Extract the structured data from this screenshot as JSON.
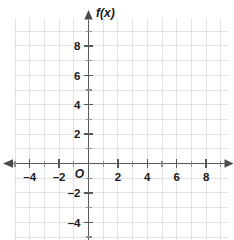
{
  "chart_data": {
    "type": "line",
    "title": "",
    "subtitle": "",
    "xlabel": "",
    "ylabel": "f(x)",
    "y_axis_name": "f(x)",
    "origin_label": "O",
    "grid": true,
    "grid_step": 1,
    "legend": null,
    "legend_position": "none",
    "series": [],
    "annotations": [],
    "xlim": [
      -5,
      9.5
    ],
    "ylim": [
      -5,
      9.5
    ],
    "x_major_step": 2,
    "x_minor_step": 1,
    "y_major_step": 2,
    "y_minor_step": 1,
    "x_tick_labels": [
      "–4",
      "–2",
      "2",
      "4",
      "6",
      "8"
    ],
    "x_tick_values": [
      -4,
      -2,
      2,
      4,
      6,
      8
    ],
    "y_tick_labels": [
      "8",
      "6",
      "4",
      "2",
      "–2",
      "–4"
    ],
    "y_tick_values": [
      8,
      6,
      4,
      2,
      -2,
      -4
    ],
    "colors": {
      "grid": "#e3e3e3",
      "axis": "#595959",
      "text": "#1a1a1a",
      "background": "#ffffff",
      "tick_minor": "#8d8d8d"
    },
    "arrows": {
      "x_left": true,
      "x_right": true,
      "y_top": true,
      "y_bottom": false
    }
  },
  "graph": {
    "y_axis_name": "f(x)",
    "origin_label": "O",
    "x_labels": [
      {
        "text": "–4",
        "value": -4
      },
      {
        "text": "–2",
        "value": -2
      },
      {
        "text": "2",
        "value": 2
      },
      {
        "text": "4",
        "value": 4
      },
      {
        "text": "6",
        "value": 6
      },
      {
        "text": "8",
        "value": 8
      }
    ],
    "y_labels": [
      {
        "text": "8",
        "value": 8
      },
      {
        "text": "6",
        "value": 6
      },
      {
        "text": "4",
        "value": 4
      },
      {
        "text": "2",
        "value": 2
      },
      {
        "text": "–2",
        "value": -2
      },
      {
        "text": "–4",
        "value": -4
      }
    ]
  }
}
